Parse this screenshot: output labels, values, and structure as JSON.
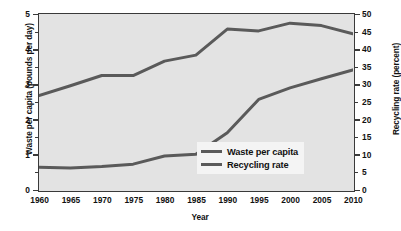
{
  "chart_data": {
    "type": "line",
    "title": "",
    "xlabel": "Year",
    "x": [
      1960,
      1965,
      1970,
      1975,
      1980,
      1985,
      1990,
      1995,
      2000,
      2005,
      2010
    ],
    "xlim": [
      1960,
      2010
    ],
    "xticks": [
      "1960",
      "1965",
      "1970",
      "1975",
      "1980",
      "1985",
      "1990",
      "1995",
      "2000",
      "2005",
      "2010"
    ],
    "grid": false,
    "legend_position": "lower right",
    "series": [
      {
        "name": "Waste per capita",
        "axis": "left",
        "unit": "pounds per day",
        "color": "#5a5a5a",
        "values": [
          2.68,
          2.96,
          3.25,
          3.25,
          3.66,
          3.83,
          4.57,
          4.52,
          4.74,
          4.67,
          4.44
        ]
      },
      {
        "name": "Recycling rate",
        "axis": "right",
        "unit": "percent",
        "color": "#5a5a5a",
        "values": [
          6.4,
          6.2,
          6.6,
          7.3,
          9.6,
          10.1,
          16.2,
          25.7,
          29.0,
          31.6,
          34.1
        ]
      }
    ],
    "left_axis": {
      "label": "Waste per capita (pounds per day)",
      "ticks": [
        "0",
        "1",
        "2",
        "3",
        "4",
        "5"
      ],
      "tick_values": [
        0,
        1,
        2,
        3,
        4,
        5
      ],
      "minor_tick_values": [
        0.5,
        1.5,
        2.5,
        3.5,
        4.5
      ],
      "lim": [
        0,
        5
      ]
    },
    "right_axis": {
      "label": "Recycling rate (percent)",
      "ticks": [
        "0",
        "5",
        "10",
        "15",
        "20",
        "25",
        "30",
        "35",
        "40",
        "45",
        "50"
      ],
      "tick_values": [
        0,
        5,
        10,
        15,
        20,
        25,
        30,
        35,
        40,
        45,
        50
      ],
      "major_tick_values": [
        0,
        10,
        20,
        30,
        40,
        50
      ],
      "lim": [
        0,
        50
      ]
    },
    "legend": [
      {
        "label": "Waste per capita",
        "color": "#5a5a5a"
      },
      {
        "label": "Recycling rate",
        "color": "#5a5a5a"
      }
    ],
    "colors": {
      "plot_background": "#e3e3e3",
      "frame": "#3a3a3a",
      "line": "#5a5a5a",
      "page_background": "#ffffff",
      "legend_background": "#f4f4f4"
    }
  }
}
